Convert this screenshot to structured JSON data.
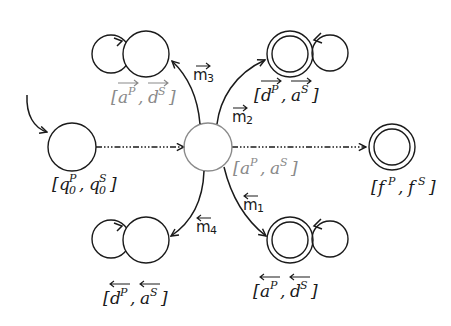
{
  "diagram": {
    "colors": {
      "ink": "#1a1a1a",
      "gray": "#8a8a8a"
    },
    "states": [
      {
        "id": "init",
        "label_base": [
          "q",
          "q"
        ],
        "sup": [
          "P",
          "S"
        ],
        "sub": [
          "0",
          "0"
        ],
        "accepting": false,
        "self_loop": false,
        "initial": true,
        "gray": false,
        "arrow": "none"
      },
      {
        "id": "center",
        "label_base": [
          "a",
          "a"
        ],
        "sup": [
          "P",
          "S"
        ],
        "accepting": false,
        "self_loop": false,
        "gray": true,
        "arrow": "none"
      },
      {
        "id": "top-left",
        "label_base": [
          "a",
          "d"
        ],
        "sup": [
          "P",
          "S"
        ],
        "accepting": false,
        "self_loop": true,
        "gray": true,
        "arrow": "right"
      },
      {
        "id": "top-right",
        "label_base": [
          "d",
          "a"
        ],
        "sup": [
          "P",
          "S"
        ],
        "accepting": true,
        "self_loop": true,
        "gray": false,
        "arrow": "right"
      },
      {
        "id": "bottom-left",
        "label_base": [
          "d",
          "a"
        ],
        "sup": [
          "P",
          "S"
        ],
        "accepting": false,
        "self_loop": true,
        "gray": false,
        "arrow": "left"
      },
      {
        "id": "bottom-right",
        "label_base": [
          "a",
          "d"
        ],
        "sup": [
          "P",
          "S"
        ],
        "accepting": true,
        "self_loop": true,
        "gray": false,
        "arrow": "left"
      },
      {
        "id": "final",
        "label_base": [
          "f",
          "f"
        ],
        "sup": [
          "P",
          "S"
        ],
        "accepting": true,
        "self_loop": false,
        "gray": false,
        "arrow": "none"
      }
    ],
    "transitions": [
      {
        "from": "init",
        "to": "center",
        "style": "dash-dot",
        "label": ""
      },
      {
        "from": "center",
        "to": "final",
        "style": "dash-dot",
        "label": ""
      },
      {
        "from": "center",
        "to": "top-left",
        "style": "solid",
        "label": "m",
        "index": "3",
        "arrow": "right"
      },
      {
        "from": "center",
        "to": "top-right",
        "style": "solid",
        "label": "m",
        "index": "2",
        "arrow": "right"
      },
      {
        "from": "center",
        "to": "bottom-left",
        "style": "solid",
        "label": "m",
        "index": "4",
        "arrow": "left"
      },
      {
        "from": "center",
        "to": "bottom-right",
        "style": "solid",
        "label": "m",
        "index": "1",
        "arrow": "left"
      }
    ],
    "text": {
      "open_bracket": "[",
      "close_bracket": "]",
      "comma": ","
    }
  }
}
